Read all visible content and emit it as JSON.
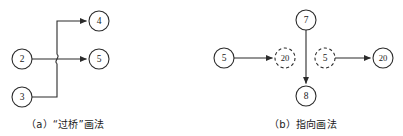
{
  "figure": {
    "background_color": "#ffffff",
    "line_color": "#2b2b2b",
    "text_color": "#1a1a1a"
  },
  "panels": [
    {
      "id": "panel-a",
      "caption": "（a）“过桥”画法",
      "style": "bridge-hop",
      "nodes": [
        {
          "id": "a-n2",
          "label": "2",
          "shape": "circle",
          "border": "solid",
          "cx": 22,
          "cy": 59,
          "r": 10
        },
        {
          "id": "a-n3",
          "label": "3",
          "shape": "circle",
          "border": "solid",
          "cx": 22,
          "cy": 97,
          "r": 10
        },
        {
          "id": "a-n4",
          "label": "4",
          "shape": "circle",
          "border": "solid",
          "cx": 99,
          "cy": 21,
          "r": 10
        },
        {
          "id": "a-n5",
          "label": "5",
          "shape": "circle",
          "border": "solid",
          "cx": 99,
          "cy": 59,
          "r": 10
        }
      ],
      "edges": [
        {
          "id": "a-e-2-5",
          "from": "2",
          "to": "5",
          "arrow": true,
          "routing": "horizontal"
        },
        {
          "id": "a-e-3-4",
          "from": "3",
          "to": "4",
          "arrow": true,
          "routing": "orthogonal-up-with-bridge"
        }
      ],
      "bridge": {
        "x": 57,
        "y": 59,
        "note": "vertical line hops over horizontal line"
      }
    },
    {
      "id": "panel-b",
      "caption": "（b）指向画法",
      "style": "pointer-reference",
      "nodes": [
        {
          "id": "b-n5s",
          "label": "5",
          "shape": "circle",
          "border": "solid",
          "cx": 224,
          "cy": 58,
          "r": 10
        },
        {
          "id": "b-n20d",
          "label": "20",
          "shape": "circle",
          "border": "dashed",
          "cx": 285,
          "cy": 58,
          "r": 10
        },
        {
          "id": "b-n5d",
          "label": "5",
          "shape": "circle",
          "border": "dashed",
          "cx": 325,
          "cy": 58,
          "r": 10
        },
        {
          "id": "b-n20s",
          "label": "20",
          "shape": "circle",
          "border": "solid",
          "cx": 383,
          "cy": 58,
          "r": 10
        },
        {
          "id": "b-n7",
          "label": "7",
          "shape": "circle",
          "border": "solid",
          "cx": 306,
          "cy": 20,
          "r": 10
        },
        {
          "id": "b-n8",
          "label": "8",
          "shape": "circle",
          "border": "solid",
          "cx": 306,
          "cy": 96,
          "r": 10
        }
      ],
      "edges": [
        {
          "id": "b-e-5-20",
          "from": "5",
          "to": "20",
          "arrow": true,
          "routing": "horizontal"
        },
        {
          "id": "b-e-5d-20s",
          "from": "5",
          "to": "20",
          "arrow": true,
          "routing": "horizontal"
        },
        {
          "id": "b-e-7-8",
          "from": "7",
          "to": "8",
          "arrow": true,
          "routing": "vertical"
        }
      ]
    }
  ]
}
